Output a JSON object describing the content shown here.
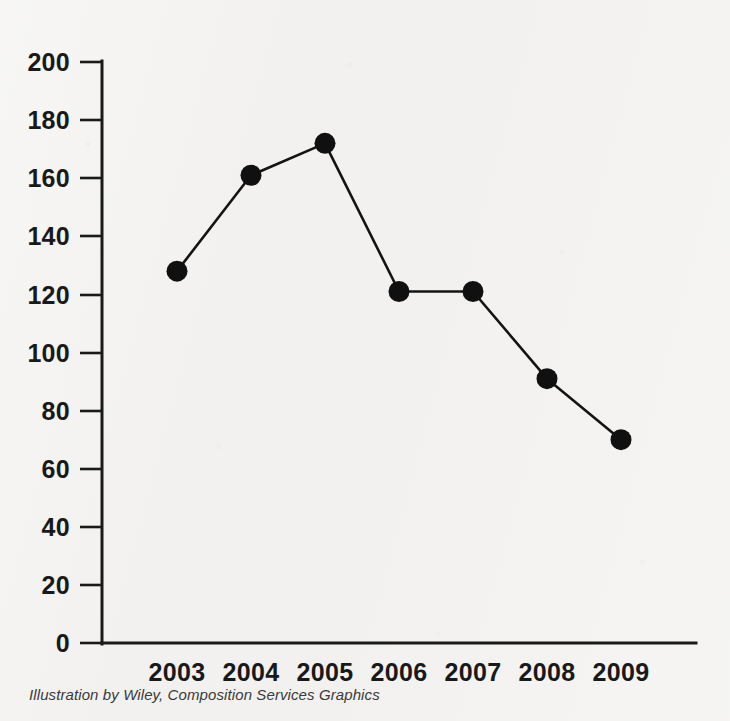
{
  "chart_data": {
    "type": "line",
    "title": "",
    "subtitle": "",
    "xlabel": "",
    "ylabel": "",
    "categories": [
      "2003",
      "2004",
      "2005",
      "2006",
      "2007",
      "2008",
      "2009"
    ],
    "values": [
      128,
      161,
      172,
      121,
      121,
      91,
      70
    ],
    "series": [
      {
        "name": "",
        "values": [
          128,
          161,
          172,
          121,
          121,
          91,
          70
        ]
      }
    ],
    "ylim": [
      0,
      200
    ],
    "yticks": [
      0,
      20,
      40,
      60,
      80,
      100,
      120,
      140,
      160,
      180,
      200
    ],
    "ytick_labels": [
      "0",
      "20",
      "40",
      "60",
      "80",
      "100",
      "120",
      "140",
      "160",
      "180",
      "200"
    ],
    "xtick_labels": [
      "2003",
      "2004",
      "2005",
      "2006",
      "2007",
      "2008",
      "2009"
    ],
    "grid": false,
    "legend": false,
    "legend_position": "none",
    "marker": "filled-circle",
    "line_color": "#141414",
    "marker_color": "#101010",
    "axis_color": "#1a1a1a",
    "background_color": "#f2f1ef"
  },
  "caption": {
    "text": "Illustration by Wiley, Composition Services Graphics"
  }
}
